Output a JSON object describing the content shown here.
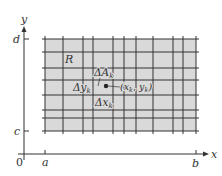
{
  "figure": {
    "axes": {
      "x_label": "x",
      "y_label": "y",
      "origin_label": "0",
      "x_ticks": [
        {
          "label": "a"
        },
        {
          "label": "b"
        }
      ],
      "y_ticks": [
        {
          "label": "c"
        },
        {
          "label": "d"
        }
      ]
    },
    "region": {
      "label": "R",
      "fill_color": "#d9d9d9",
      "grid_color": "#333333"
    },
    "element": {
      "area_label": "ΔA",
      "area_sub": "k",
      "dy_label": "Δy",
      "dy_sub": "k",
      "dx_label": "Δx",
      "dx_sub": "k",
      "point_label_open": "(x",
      "point_sub1": "k",
      "point_label_mid": ", y",
      "point_sub2": "k",
      "point_label_close": ")"
    }
  }
}
